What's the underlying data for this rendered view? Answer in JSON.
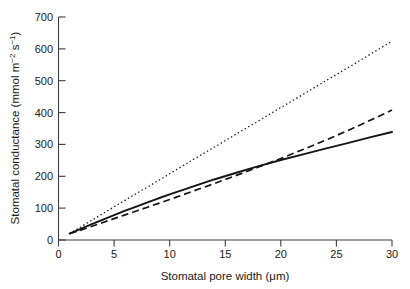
{
  "chart_data": {
    "type": "line",
    "title": "",
    "xlabel_parts": {
      "main": "Stomatal pore width (",
      "unit": "μm",
      "tail": ")"
    },
    "xlabel": "Stomatal pore width (μm)",
    "ylabel_parts": {
      "lead": "Stomatal conductance (mmol m",
      "sup1": "−2",
      "mid": " s",
      "sup2": "−1",
      "tail": ")"
    },
    "ylabel": "Stomatal conductance (mmol m−2 s−1)",
    "xlim": [
      0,
      30
    ],
    "ylim": [
      0,
      700
    ],
    "xticks": [
      0,
      5,
      10,
      15,
      20,
      25,
      30
    ],
    "xtick_labels": [
      "0",
      "5",
      "10",
      "15",
      "20",
      "25",
      "30"
    ],
    "yticks": [
      0,
      100,
      200,
      300,
      400,
      500,
      600,
      700
    ],
    "ytick_labels": [
      "0",
      "100",
      "200",
      "300",
      "400",
      "500",
      "600",
      "700"
    ],
    "grid": false,
    "legend": "none",
    "series": [
      {
        "name": "dotted-model",
        "style": "dotted",
        "color": "#141414",
        "x": [
          1,
          2,
          3,
          4,
          5,
          6,
          7,
          8,
          9,
          10,
          12,
          14,
          16,
          18,
          20,
          22,
          24,
          26,
          28,
          30
        ],
        "values": [
          20,
          41,
          62,
          83,
          104,
          125,
          146,
          166,
          187,
          208,
          250,
          291,
          333,
          374,
          416,
          457,
          499,
          540,
          582,
          624
        ]
      },
      {
        "name": "solid-model",
        "style": "solid",
        "color": "#141414",
        "x": [
          1,
          2,
          3,
          4,
          5,
          6,
          7,
          8,
          9,
          10,
          12,
          14,
          16,
          18,
          20,
          22,
          24,
          26,
          28,
          30
        ],
        "values": [
          20,
          35,
          50,
          64,
          78,
          92,
          105,
          118,
          131,
          143,
          167,
          190,
          211,
          232,
          251,
          269,
          287,
          304,
          322,
          339
        ]
      },
      {
        "name": "dashed-model",
        "style": "dashed",
        "color": "#141414",
        "x": [
          1,
          2,
          3,
          4,
          5,
          6,
          7,
          8,
          9,
          10,
          12,
          14,
          16,
          18,
          20,
          22,
          24,
          26,
          28,
          30
        ],
        "values": [
          20,
          31,
          43,
          55,
          67,
          79,
          91,
          103,
          115,
          127,
          152,
          177,
          203,
          229,
          256,
          284,
          313,
          343,
          375,
          408
        ]
      }
    ],
    "annotations": []
  },
  "axis": {
    "x_tick_label_0": "0",
    "x_tick_label_1": "5",
    "x_tick_label_2": "10",
    "x_tick_label_3": "15",
    "x_tick_label_4": "20",
    "x_tick_label_5": "25",
    "x_tick_label_6": "30",
    "y_tick_label_0": "0",
    "y_tick_label_1": "100",
    "y_tick_label_2": "200",
    "y_tick_label_3": "300",
    "y_tick_label_4": "400",
    "y_tick_label_5": "500",
    "y_tick_label_6": "600",
    "y_tick_label_7": "700"
  }
}
